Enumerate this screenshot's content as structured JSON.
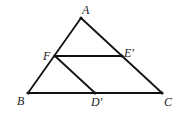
{
  "diagram": {
    "stroke_color": "#111111",
    "label_color": "#222222",
    "points": {
      "A": {
        "label": "A",
        "x": 81,
        "y": 18,
        "lx": 82,
        "ly": 14
      },
      "B": {
        "label": "B",
        "x": 28,
        "y": 93,
        "lx": 17,
        "ly": 105
      },
      "C": {
        "label": "C",
        "x": 162,
        "y": 93,
        "lx": 164,
        "ly": 106
      },
      "F": {
        "label": "F",
        "x": 55,
        "y": 56,
        "lx": 43,
        "ly": 60
      },
      "E'": {
        "label": "E'",
        "x": 122,
        "y": 56,
        "lx": 124,
        "ly": 57
      },
      "D'": {
        "label": "D'",
        "x": 95,
        "y": 93,
        "lx": 91,
        "ly": 106
      }
    },
    "labels": {
      "A": "A",
      "B": "B",
      "C": "C",
      "F": "F",
      "E": "E'",
      "D": "D'"
    },
    "segments": [
      {
        "from": "A",
        "to": "B"
      },
      {
        "from": "A",
        "to": "C"
      },
      {
        "from": "B",
        "to": "C"
      },
      {
        "from": "F",
        "to": "E'"
      },
      {
        "from": "F",
        "to": "D'"
      }
    ]
  }
}
